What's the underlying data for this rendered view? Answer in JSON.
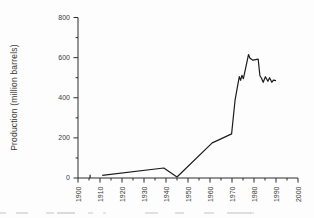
{
  "chart_data": {
    "type": "line",
    "title": "",
    "xlabel": "",
    "ylabel": "Production (million barrels)",
    "xlim": [
      1900,
      2000
    ],
    "ylim": [
      0,
      800
    ],
    "x_major_ticks": [
      1900,
      1910,
      1920,
      1930,
      1940,
      1950,
      1960,
      1970,
      1980,
      1990,
      2000
    ],
    "x_tick_labels": [
      "1900",
      "1910",
      "1920",
      "1930",
      "1940",
      "1950",
      "1960",
      "1970",
      "1980",
      "1990",
      "2000"
    ],
    "x_minor_tick_step": 5,
    "y_major_ticks": [
      0,
      200,
      400,
      600,
      800
    ],
    "y_tick_labels": [
      "0",
      "200",
      "400",
      "600",
      "800"
    ],
    "y_minor_tick_step": 100,
    "grid": false,
    "legend_position": "none",
    "axis_color": "#2d2d2d",
    "text_color": "#3a3a3a",
    "line_color": "#1c1c1c",
    "series": [
      {
        "name": "production",
        "points": [
          [
            1911,
            13
          ],
          [
            1939,
            50
          ],
          [
            1945,
            5
          ],
          [
            1961,
            175
          ],
          [
            1964,
            190
          ],
          [
            1969.8,
            220
          ],
          [
            1971.4,
            390
          ],
          [
            1972.6,
            462
          ],
          [
            1973.3,
            505
          ],
          [
            1973.9,
            487
          ],
          [
            1974.5,
            512
          ],
          [
            1975.2,
            495
          ],
          [
            1977.5,
            615
          ],
          [
            1978.2,
            597
          ],
          [
            1979.5,
            587
          ],
          [
            1981.9,
            592
          ],
          [
            1982.7,
            510
          ],
          [
            1983.4,
            497
          ],
          [
            1984.2,
            477
          ],
          [
            1985.2,
            505
          ],
          [
            1986.3,
            482
          ],
          [
            1987.1,
            500
          ],
          [
            1988.1,
            477
          ],
          [
            1988.8,
            488
          ],
          [
            1990,
            485
          ]
        ]
      },
      {
        "name": "early-isolated-mark",
        "points": [
          [
            1905.5,
            0
          ],
          [
            1905.5,
            16
          ]
        ]
      }
    ]
  }
}
